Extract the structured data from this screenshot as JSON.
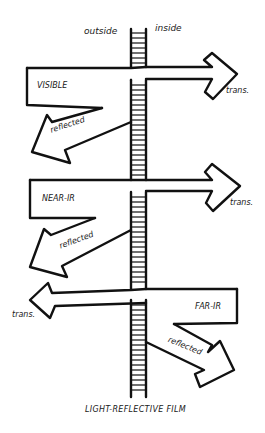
{
  "diagram": {
    "caption": "LIGHT-REFLECTIVE FILM",
    "side_labels": {
      "outside": "outside",
      "inside": "inside"
    },
    "bands": [
      {
        "name": "VISIBLE",
        "transmitted_label": "trans.",
        "reflected_label": "reflected",
        "transmitted_direction": "right"
      },
      {
        "name": "NEAR-IR",
        "transmitted_label": "trans.",
        "reflected_label": "reflected",
        "transmitted_direction": "right"
      },
      {
        "name": "FAR-IR",
        "transmitted_label": "trans.",
        "reflected_label": "reflected",
        "transmitted_direction": "left"
      }
    ],
    "colors": {
      "ink": "#111111",
      "background": "#ffffff"
    }
  }
}
